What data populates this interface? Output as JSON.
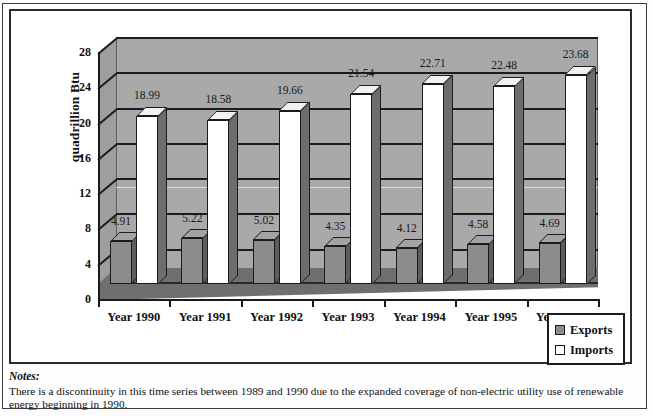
{
  "chart_data": {
    "type": "bar",
    "title": "",
    "subtitle": "",
    "xlabel": "",
    "ylabel": "quadrillion Btu",
    "categories": [
      "Year 1990",
      "Year 1991",
      "Year 1992",
      "Year 1993",
      "Year 1994",
      "Year 1995",
      "Year 1996"
    ],
    "series": [
      {
        "name": "Exports",
        "values": [
          4.91,
          5.22,
          5.02,
          4.35,
          4.12,
          4.58,
          4.69
        ],
        "color": "#8c8c8c"
      },
      {
        "name": "Imports",
        "values": [
          18.99,
          18.58,
          19.66,
          21.54,
          22.71,
          22.48,
          23.68
        ],
        "color": "#ffffff"
      }
    ],
    "ylim": [
      0,
      28
    ],
    "yticks": [
      0,
      4,
      8,
      12,
      16,
      20,
      24,
      28
    ],
    "ytick_labels": [
      "0",
      "4",
      "8",
      "12",
      "16",
      "20",
      "24",
      "28"
    ],
    "grid": true,
    "legend_position": "bottom-right",
    "style": "3d-column"
  },
  "axis": {
    "y_title": "quadrillion Btu"
  },
  "legend": {
    "items": [
      {
        "label": "Exports",
        "swatch": "exports"
      },
      {
        "label": "Imports",
        "swatch": "imports"
      }
    ]
  },
  "notes": {
    "heading": "Notes:",
    "text": "There is a discontinuity in this time series between 1989 and 1990 due to the expanded coverage of non-electric utility use of renewable energy beginning in 1990."
  }
}
